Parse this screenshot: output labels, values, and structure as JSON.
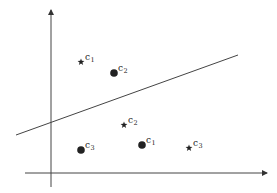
{
  "diagram": {
    "title": "",
    "axes": {
      "x_axis": {
        "from": [
          25,
          173
        ],
        "to": [
          267,
          173
        ],
        "arrow": true
      },
      "y_axis": {
        "from": [
          51,
          187
        ],
        "to": [
          51,
          10
        ],
        "arrow": true
      }
    },
    "separator_line": {
      "from": [
        16,
        135
      ],
      "to": [
        238,
        55
      ]
    },
    "points": [
      {
        "marker": "star",
        "label": "c",
        "sub": "1",
        "x": 81,
        "y": 62
      },
      {
        "marker": "circle",
        "label": "c",
        "sub": "2",
        "x": 114,
        "y": 73
      },
      {
        "marker": "star",
        "label": "c",
        "sub": "2",
        "x": 124,
        "y": 125
      },
      {
        "marker": "circle",
        "label": "c",
        "sub": "1",
        "x": 142,
        "y": 145
      },
      {
        "marker": "circle",
        "label": "c",
        "sub": "3",
        "x": 81,
        "y": 150
      },
      {
        "marker": "star",
        "label": "c",
        "sub": "3",
        "x": 189,
        "y": 148
      }
    ],
    "colors": {
      "ink": "#222222",
      "axis": "#444444",
      "background": "#ffffff"
    }
  }
}
